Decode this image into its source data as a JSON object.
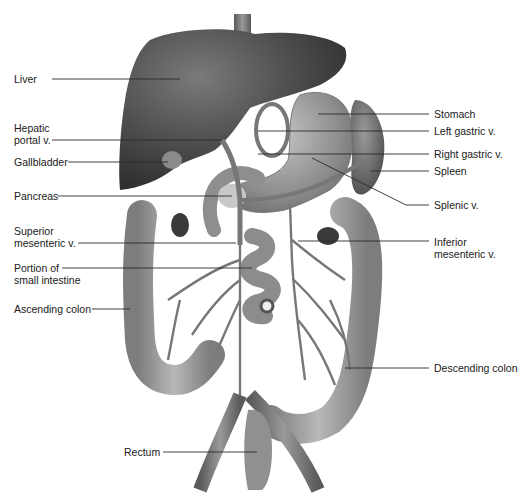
{
  "diagram": {
    "palette": {
      "background": "#ffffff",
      "label_text": "#1a1a1a",
      "leader_line": "#2a2a2a",
      "liver": "#4a4a4a",
      "organ_mid": "#8c8c8c",
      "organ_light": "#a8a8a8",
      "vessel": "#6e6e6e",
      "pancreas": "#c8c8c8"
    },
    "labels_left": [
      {
        "id": "liver",
        "text": "Liver",
        "x": 14,
        "y": 73,
        "line": [
          52,
          79,
          180,
          79
        ]
      },
      {
        "id": "hepatic-portal-v",
        "text": "Hepatic\nportal v.",
        "x": 14,
        "y": 122,
        "line": [
          52,
          140,
          222,
          140
        ]
      },
      {
        "id": "gallbladder",
        "text": "Gallbladder",
        "x": 14,
        "y": 156,
        "line": [
          68,
          162,
          168,
          162
        ]
      },
      {
        "id": "pancreas",
        "text": "Pancreas",
        "x": 14,
        "y": 190,
        "line": [
          58,
          196,
          232,
          196
        ]
      },
      {
        "id": "superior-mesenteric-v",
        "text": "Superior\nmesenteric v.",
        "x": 14,
        "y": 225,
        "line": [
          78,
          243,
          236,
          243
        ]
      },
      {
        "id": "portion-of-small-intestine",
        "text": "Portion of\nsmall intestine",
        "x": 14,
        "y": 262,
        "line": [
          62,
          268,
          252,
          268
        ]
      },
      {
        "id": "ascending-colon",
        "text": "Ascending colon",
        "x": 14,
        "y": 303,
        "line": [
          92,
          309,
          130,
          309
        ]
      },
      {
        "id": "rectum",
        "text": "Rectum",
        "x": 124,
        "y": 446,
        "line": [
          163,
          452,
          257,
          452
        ]
      }
    ],
    "labels_right": [
      {
        "id": "stomach",
        "text": "Stomach",
        "x": 434,
        "y": 108,
        "line": [
          318,
          114,
          429,
          114
        ]
      },
      {
        "id": "left-gastric-v",
        "text": "Left gastric v.",
        "x": 434,
        "y": 125,
        "line": [
          258,
          131,
          429,
          131
        ]
      },
      {
        "id": "right-gastric-v",
        "text": "Right gastric v.",
        "x": 434,
        "y": 148,
        "line": [
          258,
          154,
          429,
          154
        ]
      },
      {
        "id": "spleen",
        "text": "Spleen",
        "x": 434,
        "y": 165,
        "line": [
          371,
          171,
          429,
          171
        ]
      },
      {
        "id": "splenic-v",
        "text": "Splenic v.",
        "x": 434,
        "y": 199,
        "line": [
          312,
          158,
          406,
          205,
          429,
          205
        ]
      },
      {
        "id": "inferior-mesenteric-v",
        "text": "Inferior\nmesenteric v.",
        "x": 434,
        "y": 236,
        "line": [
          298,
          241,
          429,
          241
        ]
      },
      {
        "id": "descending-colon",
        "text": "Descending colon",
        "x": 434,
        "y": 362,
        "line": [
          345,
          368,
          429,
          368
        ]
      }
    ]
  }
}
